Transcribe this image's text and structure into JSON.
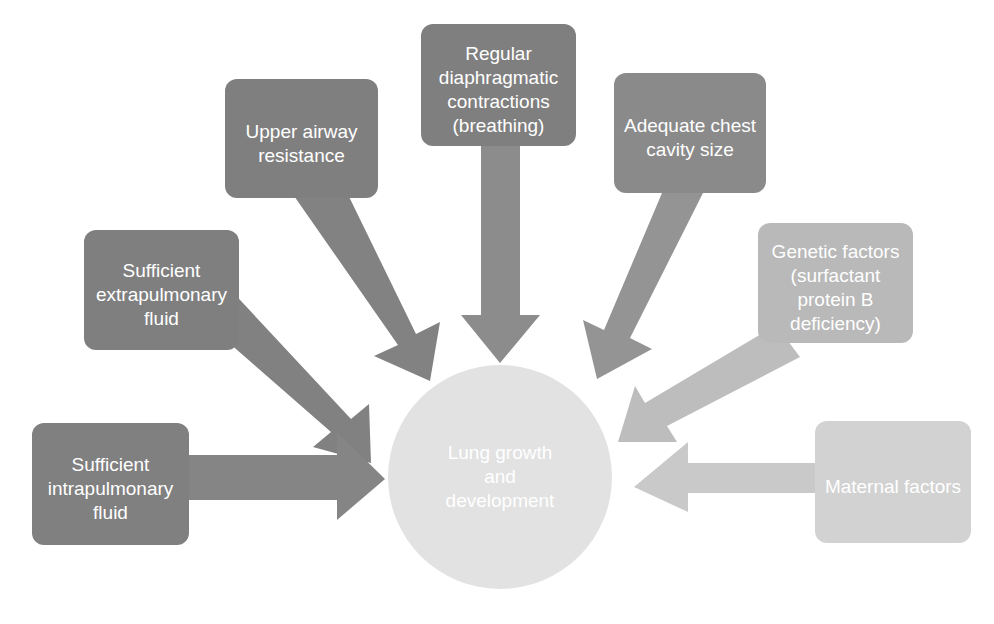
{
  "diagram": {
    "background_color": "#ffffff",
    "hub": {
      "id": "hub",
      "label_lines": [
        "Lung growth",
        "and",
        "development"
      ],
      "shape": "circle",
      "fill": "#e2e2e2",
      "text_color": "#ffffff",
      "cx": 500,
      "cy": 477,
      "r": 112
    },
    "nodes": [
      {
        "id": "regular-diaphragmatic-contractions",
        "label_lines": [
          "Regular",
          "diaphragmatic",
          "contractions",
          "(breathing)"
        ],
        "fill": "#7f7f7f",
        "text_color": "#ffffff",
        "x": 421,
        "y": 24,
        "width": 155,
        "height": 122
      },
      {
        "id": "upper-airway-resistance",
        "label_lines": [
          "Upper airway",
          "resistance"
        ],
        "fill": "#7f7f7f",
        "text_color": "#ffffff",
        "x": 225,
        "y": 79,
        "width": 153,
        "height": 119
      },
      {
        "id": "adequate-chest-cavity-size",
        "label_lines": [
          "Adequate chest",
          "cavity size"
        ],
        "fill": "#8a8a8a",
        "text_color": "#ffffff",
        "x": 614,
        "y": 73,
        "width": 152,
        "height": 120
      },
      {
        "id": "sufficient-extrapulmonary-fluid",
        "label_lines": [
          "Sufficient",
          "extrapulmonary",
          "fluid"
        ],
        "fill": "#7f7f7f",
        "text_color": "#ffffff",
        "x": 84,
        "y": 230,
        "width": 155,
        "height": 120
      },
      {
        "id": "genetic-factors",
        "label_lines": [
          "Genetic factors",
          "(surfactant",
          "protein B",
          "deficiency)"
        ],
        "fill": "#b9b9b9",
        "text_color": "#ffffff",
        "x": 758,
        "y": 223,
        "width": 155,
        "height": 120
      },
      {
        "id": "sufficient-intrapulmonary-fluid",
        "label_lines": [
          "Sufficient",
          "intrapulmonary",
          "fluid"
        ],
        "fill": "#808080",
        "text_color": "#ffffff",
        "x": 32,
        "y": 423,
        "width": 157,
        "height": 122
      },
      {
        "id": "maternal-factors",
        "label_lines": [
          "Maternal factors"
        ],
        "fill": "#d2d2d2",
        "text_color": "#ffffff",
        "x": 815,
        "y": 421,
        "width": 156,
        "height": 122
      }
    ],
    "arrows": [
      {
        "id": "arrow-upper-airway-resistance-to-hub",
        "from": "upper-airway-resistance",
        "to": "hub",
        "fill": "#828282",
        "direction": "down-right"
      },
      {
        "id": "arrow-regular-diaphragmatic-contractions-to-hub",
        "from": "regular-diaphragmatic-contractions",
        "to": "hub",
        "fill": "#8c8c8c",
        "direction": "down"
      },
      {
        "id": "arrow-adequate-chest-cavity-size-to-hub",
        "from": "adequate-chest-cavity-size",
        "to": "hub",
        "fill": "#949494",
        "direction": "down-left"
      },
      {
        "id": "arrow-sufficient-extrapulmonary-fluid-to-hub",
        "from": "sufficient-extrapulmonary-fluid",
        "to": "hub",
        "fill": "#818181",
        "direction": "down-right"
      },
      {
        "id": "arrow-genetic-factors-to-hub",
        "from": "genetic-factors",
        "to": "hub",
        "fill": "#bdbdbd",
        "direction": "down-left"
      },
      {
        "id": "arrow-sufficient-intrapulmonary-fluid-to-hub",
        "from": "sufficient-intrapulmonary-fluid",
        "to": "hub",
        "fill": "#858585",
        "direction": "right"
      },
      {
        "id": "arrow-maternal-factors-to-hub",
        "from": "maternal-factors",
        "to": "hub",
        "fill": "#c9c9c9",
        "direction": "left"
      }
    ]
  }
}
